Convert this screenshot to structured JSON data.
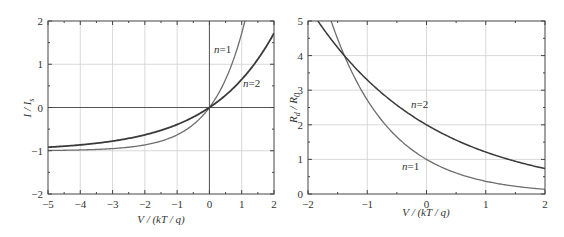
{
  "chart_data": [
    {
      "type": "line",
      "title": "",
      "xlabel": "V/(kT/q)",
      "ylabel": "I/I_s",
      "xlim": [
        -5,
        2
      ],
      "ylim": [
        -2,
        2
      ],
      "grid": true,
      "xticks": [
        "-5",
        "-4",
        "-3",
        "-2",
        "-1",
        "0",
        "1",
        "2"
      ],
      "yticks": [
        "-2",
        "-1",
        "0",
        "1",
        "2"
      ],
      "series": [
        {
          "name": "n=1",
          "label": "n=1",
          "formula": "exp(V) - 1",
          "x": [
            -5,
            -4,
            -3,
            -2,
            -1,
            -0.5,
            0,
            0.5,
            1.0,
            1.1
          ],
          "y": [
            -0.99,
            -0.98,
            -0.95,
            -0.86,
            -0.63,
            -0.39,
            0,
            0.65,
            1.72,
            2.0
          ]
        },
        {
          "name": "n=2",
          "label": "n=2",
          "formula": "exp(V/2) - 1",
          "x": [
            -5,
            -4,
            -3,
            -2,
            -1,
            0,
            1,
            2
          ],
          "y": [
            -0.92,
            -0.86,
            -0.78,
            -0.63,
            -0.39,
            0,
            0.65,
            1.72
          ]
        }
      ],
      "annotations": [
        {
          "text": "n=1"
        },
        {
          "text": "n=2"
        }
      ]
    },
    {
      "type": "line",
      "title": "",
      "xlabel": "V/(kT/q)",
      "ylabel": "R_d/R_0",
      "xlim": [
        -2,
        2
      ],
      "ylim": [
        0,
        5
      ],
      "grid": true,
      "xticks": [
        "-2",
        "-1",
        "0",
        "1",
        "2"
      ],
      "yticks": [
        "0",
        "1",
        "2",
        "3",
        "4",
        "5"
      ],
      "series": [
        {
          "name": "n=1",
          "label": "n=1",
          "formula": "exp(-V)",
          "x": [
            -1.61,
            -1.4,
            -1,
            -0.5,
            0,
            0.5,
            1,
            1.5,
            2
          ],
          "y": [
            5.0,
            4.06,
            2.72,
            1.65,
            1.0,
            0.61,
            0.37,
            0.22,
            0.14
          ]
        },
        {
          "name": "n=2",
          "label": "n=2",
          "formula": "2*exp(-V/2)",
          "x": [
            -1.83,
            -1.4,
            -1,
            -0.5,
            0,
            0.5,
            1,
            1.5,
            2
          ],
          "y": [
            5.0,
            4.03,
            3.3,
            2.57,
            2.0,
            1.56,
            1.21,
            0.94,
            0.74
          ]
        }
      ],
      "annotations": [
        {
          "text": "n=2"
        },
        {
          "text": "n=1"
        }
      ]
    }
  ],
  "left": {
    "xlabel": "V / (kT / q)",
    "ylabel_main": "I / I",
    "ylabel_sub": "s",
    "xticks": [
      "−5",
      "−4",
      "−3",
      "−2",
      "−1",
      "0",
      "1",
      "2"
    ],
    "yticks": [
      "−2",
      "−1",
      "0",
      "1",
      "2"
    ],
    "label_n1": "n=1",
    "label_n2": "n=2"
  },
  "right": {
    "xlabel": "V / (kT / q)",
    "ylabel_main1": "R",
    "ylabel_sub1": "d",
    "ylabel_mid": " / R",
    "ylabel_sub2": "0",
    "xticks": [
      "−2",
      "−1",
      "0",
      "1",
      "2"
    ],
    "yticks": [
      "0",
      "1",
      "2",
      "3",
      "4",
      "5"
    ],
    "label_n1": "n=1",
    "label_n2": "n=2"
  },
  "colors": {
    "axis": "#444444",
    "grid": "#cfcfcf",
    "curve_n1": "#6e6e6e",
    "curve_n2": "#3a3a3a"
  }
}
